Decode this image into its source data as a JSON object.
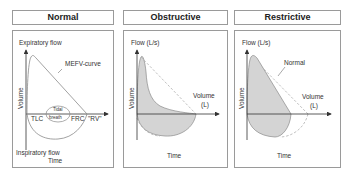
{
  "panels": [
    {
      "title": "Normal",
      "labels": {
        "expiratory": "Expiratory flow",
        "curve": "MEFV-curve",
        "yaxis": "Volume",
        "tlc": "TLC",
        "tidal_1": "Tidal",
        "tidal_2": "breath",
        "frc": "FRC",
        "rv": "\"RV\"",
        "inspiratory": "Inspiratory flow",
        "xaxis": "Time"
      }
    },
    {
      "title": "Obstructive",
      "labels": {
        "flow": "Flow (L/s)",
        "yaxis": "Volume",
        "volume_1": "Volume",
        "volume_2": "(L)",
        "xaxis": "Time"
      }
    },
    {
      "title": "Restrictive",
      "labels": {
        "flow": "Flow (L/s)",
        "normal": "Normal",
        "yaxis": "Volume",
        "volume_1": "Volume",
        "volume_2": "(L)",
        "xaxis": "Time"
      }
    }
  ],
  "colors": {
    "border": "#9a9a9a",
    "fill": "#d4d4d4",
    "curve": "#8a8a8a",
    "dashed": "#b0b0b0",
    "axis": "#333333"
  }
}
